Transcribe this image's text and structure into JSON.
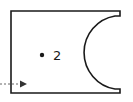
{
  "diagram": {
    "shape": "rectangle-with-concave-right-notch",
    "point_label": "2",
    "stroke_color": "#1a1a1a",
    "arrow_style": "dashed"
  }
}
